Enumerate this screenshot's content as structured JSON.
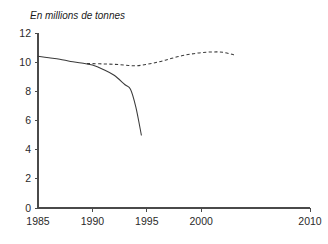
{
  "chart_data": {
    "type": "line",
    "title": "En millions de tonnes",
    "subtitle": "",
    "xlabel": "",
    "ylabel": "",
    "xlim": [
      1985,
      2010
    ],
    "ylim": [
      0,
      12
    ],
    "grid": false,
    "legend_position": "none",
    "x_ticks": [
      1985,
      1990,
      1995,
      2000,
      2010
    ],
    "x_tick_labels": [
      "1985",
      "1990",
      "1995",
      "2000",
      "2010"
    ],
    "y_ticks": [
      0,
      2,
      4,
      6,
      8,
      10,
      12
    ],
    "y_tick_labels": [
      "0",
      "2",
      "4",
      "6",
      "8",
      "10",
      "12"
    ],
    "series": [
      {
        "name": "observed",
        "style": "solid",
        "color": "#3a3a3a",
        "x": [
          1985,
          1986,
          1987,
          1988,
          1989,
          1990,
          1991,
          1992,
          1993,
          1993.5,
          1994,
          1994.5
        ],
        "values": [
          10.4,
          10.3,
          10.2,
          10.05,
          9.95,
          9.8,
          9.5,
          9.1,
          8.45,
          8.15,
          6.9,
          5.0
        ]
      },
      {
        "name": "projected",
        "style": "dashed",
        "color": "#3a3a3a",
        "x": [
          1989.5,
          1990,
          1991,
          1992,
          1993,
          1994,
          1995,
          1996,
          1997,
          1998,
          1999,
          2000,
          2001,
          2002,
          2003
        ],
        "values": [
          9.9,
          9.9,
          9.88,
          9.85,
          9.8,
          9.75,
          9.85,
          10.0,
          10.2,
          10.4,
          10.55,
          10.65,
          10.7,
          10.68,
          10.5
        ]
      }
    ]
  },
  "title": {
    "text": "En millions de tonnes"
  },
  "axes": {
    "y_axis_name": "y-axis",
    "x_axis_name": "x-axis"
  }
}
